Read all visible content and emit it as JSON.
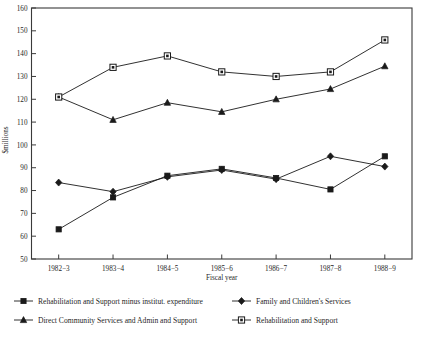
{
  "chart_data": {
    "type": "line",
    "title": "",
    "xlabel": "Fiscal year",
    "ylabel": "$millions",
    "ylim": [
      50,
      160
    ],
    "yticks": [
      50,
      60,
      70,
      80,
      90,
      100,
      110,
      120,
      130,
      140,
      150,
      160
    ],
    "grid": false,
    "legend_position": "below-plot",
    "categories": [
      "1982−3",
      "1983−4",
      "1984−5",
      "1985−6",
      "1986−7",
      "1987−8",
      "1988−9"
    ],
    "series": [
      {
        "name": "Rehabilitation and Support minus institut. expenditure",
        "marker": "filled-square",
        "values": [
          63,
          77,
          86.5,
          89.5,
          85.5,
          80.5,
          95
        ]
      },
      {
        "name": "Family and Children's Services",
        "marker": "filled-diamond",
        "values": [
          83.5,
          79.5,
          86,
          89,
          85,
          95,
          90.5
        ]
      },
      {
        "name": "Direct Community Services and Admin and Support",
        "marker": "filled-triangle",
        "values": [
          121,
          111,
          118.5,
          114.5,
          120,
          124.5,
          134.5
        ]
      },
      {
        "name": "Rehabilitation and Support",
        "marker": "open-square",
        "values": [
          121,
          134,
          139,
          132,
          130,
          132,
          146
        ]
      }
    ],
    "colors": {
      "axis": "#3a3a3a",
      "line": "#1a1a1a",
      "marker_fill": "#1a1a1a",
      "marker_open_fill": "#ffffff",
      "background": "#ffffff"
    }
  },
  "legend": {
    "entries": [
      {
        "label": "Rehabilitation and Support minus institut. expenditure",
        "marker": "filled-square"
      },
      {
        "label": "Family and Children's Services",
        "marker": "filled-diamond"
      },
      {
        "label": "Direct Community Services and Admin and Support",
        "marker": "filled-triangle"
      },
      {
        "label": "Rehabilitation and Support",
        "marker": "open-square"
      }
    ]
  }
}
